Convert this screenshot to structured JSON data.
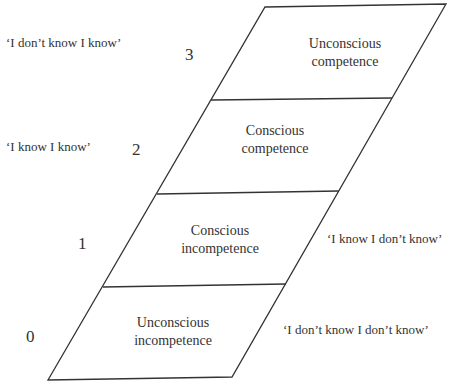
{
  "diagram": {
    "type": "stacked-parallelogram",
    "stages": [
      {
        "level": "3",
        "line1": "Unconscious",
        "line2": "competence",
        "quote": "‘I don’t know I know’"
      },
      {
        "level": "2",
        "line1": "Conscious",
        "line2": "competence",
        "quote": "‘I know I know’"
      },
      {
        "level": "1",
        "line1": "Conscious",
        "line2": "incompetence",
        "quote": "‘I know I don’t know’"
      },
      {
        "level": "0",
        "line1": "Unconscious",
        "line2": "incompetence",
        "quote": "‘I don’t know I don’t know’"
      }
    ],
    "line_color": "#333333"
  }
}
